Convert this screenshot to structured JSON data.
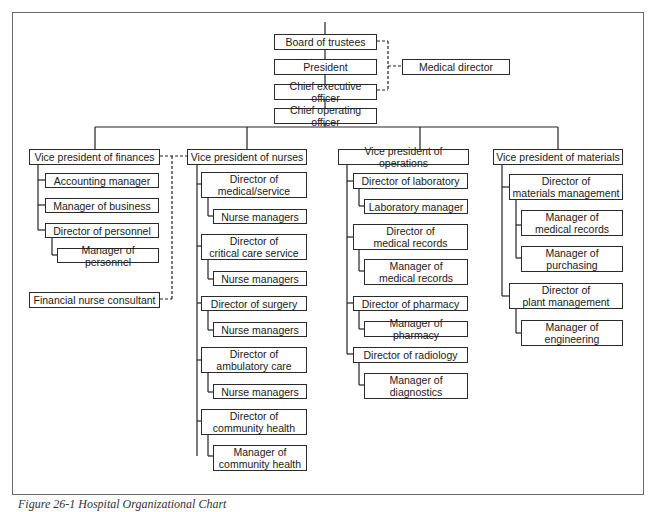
{
  "caption": "Figure 26-1 Hospital Organizational Chart",
  "top": {
    "board": "Board of trustees",
    "president": "President",
    "ceo": "Chief executive officer",
    "coo": "Chief operating officer",
    "medical_director": "Medical director"
  },
  "finances": {
    "vp": "Vice president of finances",
    "items": [
      "Accounting manager",
      "Manager of business",
      "Director of personnel",
      "Manager of personnel"
    ],
    "consultant": "Financial nurse consultant"
  },
  "nurses": {
    "vp": "Vice president of nurses",
    "items": [
      "Director of\nmedical/service",
      "Nurse managers",
      "Director of\ncritical care service",
      "Nurse managers",
      "Director of surgery",
      "Nurse managers",
      "Director of\nambulatory care",
      "Nurse managers",
      "Director of\ncommunity health",
      "Manager of\ncommunity health"
    ]
  },
  "operations": {
    "vp": "Vice president of operations",
    "items": [
      "Director of laboratory",
      "Laboratory manager",
      "Director of\nmedical records",
      "Manager of\nmedical records",
      "Director of pharmacy",
      "Manager of pharmacy",
      "Director of radiology",
      "Manager of\ndiagnostics"
    ]
  },
  "materials": {
    "vp": "Vice president of materials",
    "items": [
      "Director of\nmaterials management",
      "Manager of\nmedical records",
      "Manager of\npurchasing",
      "Director of\nplant management",
      "Manager of\nengineering"
    ]
  }
}
